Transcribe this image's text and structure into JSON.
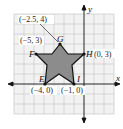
{
  "diagram": {
    "type": "coordinate-plane-star",
    "axes": {
      "x_label": "x",
      "y_label": "y"
    },
    "grid": {
      "x_min": -7,
      "x_max": 3,
      "y_min": -3,
      "y_max": 7,
      "cell_px": 10,
      "origin_px": [
        84,
        84
      ]
    },
    "colors": {
      "grid": "#bdbdbd",
      "grid_bg": "#efefef",
      "star_fill": "#8c8c8c",
      "star_stroke": "#111111",
      "axis": "#111111"
    },
    "points": [
      {
        "name": "E",
        "coord_label": "(−4, 0)"
      },
      {
        "name": "F",
        "coord_label": "(−5, 3)"
      },
      {
        "name": "G",
        "coord_label": "(−2.5, 4)"
      },
      {
        "name": "H",
        "coord_label": "(0, 3)"
      },
      {
        "name": "I",
        "coord_label": "(−1, 0)"
      }
    ]
  }
}
